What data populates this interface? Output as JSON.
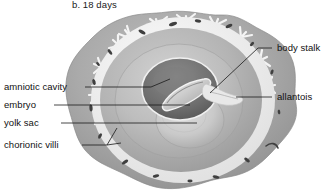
{
  "figure": {
    "caption": "b.  18 days",
    "type": "anatomical-diagram",
    "style": "grayscale halftone illustration"
  },
  "labels": {
    "left": [
      {
        "name": "amniotic-cavity",
        "text": "amniotic cavity"
      },
      {
        "name": "embryo",
        "text": "embryo"
      },
      {
        "name": "yolk-sac",
        "text": "yolk sac"
      },
      {
        "name": "chorionic-villi",
        "text": "chorionic villi"
      }
    ],
    "right": [
      {
        "name": "body-stalk",
        "text": "body stalk"
      },
      {
        "name": "allantois",
        "text": "allantois"
      }
    ]
  },
  "colors": {
    "decidua": "#a8a8a8",
    "decidua_dark": "#8e8e8e",
    "villi_white": "#f2f2f2",
    "chorion_ring": "#ededed",
    "chorionic_cavity": "#b6b6b6",
    "inner_cavity": "#c3c3c3",
    "amnion_dark": "#6f6f6f",
    "embryo_band": "#d8d8d8",
    "yolk_sac": "#cfcfcf",
    "vessel_spot": "#3c3c3c",
    "leader_line": "#1b1b1b",
    "text": "#111111",
    "background": "#ffffff"
  }
}
